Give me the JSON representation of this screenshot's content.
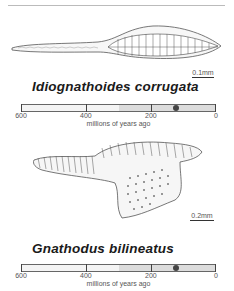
{
  "specimens": [
    {
      "name": "Idiognathoides corrugata",
      "scale_label": "0.1mm",
      "timeline": {
        "ticks": [
          "600",
          "400",
          "200",
          "0"
        ],
        "caption": "millions of years ago",
        "range_start_mya": 300,
        "range_end_mya": 0,
        "marker_mya": 120
      }
    },
    {
      "name": "Gnathodus bilineatus",
      "scale_label": "0.2mm",
      "timeline": {
        "ticks": [
          "600",
          "400",
          "200",
          "0"
        ],
        "caption": "millions of years ago",
        "range_start_mya": 300,
        "range_end_mya": 0,
        "marker_mya": 120
      }
    }
  ],
  "colors": {
    "bar_bg": "#f4f4f4",
    "bar_shade": "#dcdcdc",
    "marker": "#444444"
  }
}
